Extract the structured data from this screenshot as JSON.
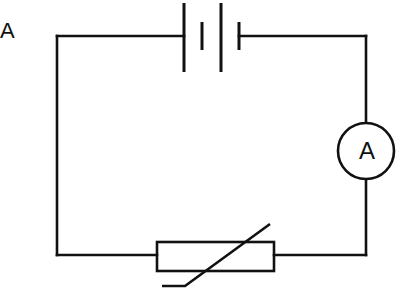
{
  "diagram": {
    "type": "circuit",
    "corner_label": "A",
    "ammeter": {
      "symbol": "A",
      "name": "ammeter"
    },
    "components": [
      {
        "name": "battery",
        "cells": 2
      },
      {
        "name": "ammeter",
        "symbol": "A"
      },
      {
        "name": "thermistor"
      }
    ],
    "colors": {
      "line": "#111111",
      "background": "#ffffff"
    }
  }
}
